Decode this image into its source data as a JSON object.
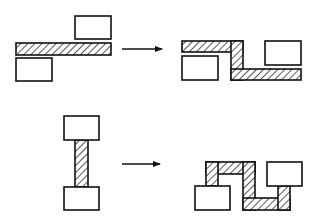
{
  "diagram": {
    "colors": {
      "stroke": "#111111",
      "fill": "#ffffff",
      "hatch": "#111111"
    },
    "rows": [
      {
        "name": "horizontal-connection",
        "before": {
          "blocks": [
            {
              "id": "block-upper-right",
              "x": 75,
              "y": 16,
              "w": 36,
              "h": 23
            },
            {
              "id": "block-lower-left",
              "x": 16,
              "y": 58,
              "w": 36,
              "h": 23
            }
          ],
          "wires": [
            {
              "id": "bar",
              "x": 16,
              "y": 43,
              "w": 95,
              "h": 12
            }
          ]
        },
        "arrow": {
          "x1": 122,
          "y1": 49,
          "x2": 162,
          "y2": 49
        },
        "after": {
          "blocks": [
            {
              "id": "block-left",
              "x": 182,
              "y": 56,
              "w": 36,
              "h": 24
            },
            {
              "id": "block-right",
              "x": 265,
              "y": 41,
              "w": 36,
              "h": 24
            }
          ],
          "wires": [
            {
              "id": "top-segment",
              "x": 182,
              "y": 41,
              "w": 61,
              "h": 11
            },
            {
              "id": "vertical-segment",
              "x": 231,
              "y": 41,
              "w": 12,
              "h": 39
            },
            {
              "id": "bottom-segment",
              "x": 231,
              "y": 69,
              "w": 70,
              "h": 11
            }
          ]
        }
      },
      {
        "name": "vertical-connection",
        "before": {
          "blocks": [
            {
              "id": "block-top",
              "x": 64,
              "y": 116,
              "w": 35,
              "h": 24
            },
            {
              "id": "block-bottom",
              "x": 64,
              "y": 187,
              "w": 35,
              "h": 23
            }
          ],
          "wires": [
            {
              "id": "stem",
              "x": 75,
              "y": 140,
              "w": 13,
              "h": 47
            }
          ]
        },
        "arrow": {
          "x1": 122,
          "y1": 164,
          "x2": 160,
          "y2": 164
        },
        "after": {
          "blocks": [
            {
              "id": "block-left",
              "x": 195,
              "y": 186,
              "w": 35,
              "h": 24
            },
            {
              "id": "block-right",
              "x": 267,
              "y": 162,
              "w": 35,
              "h": 24
            }
          ],
          "wires": [
            {
              "id": "top-segment",
              "x": 206,
              "y": 162,
              "w": 49,
              "h": 12
            },
            {
              "id": "left-drop",
              "x": 206,
              "y": 162,
              "w": 12,
              "h": 24
            },
            {
              "id": "middle-vertical",
              "x": 243,
              "y": 162,
              "w": 12,
              "h": 48
            },
            {
              "id": "bottom-segment",
              "x": 243,
              "y": 198,
              "w": 47,
              "h": 12
            },
            {
              "id": "right-rise",
              "x": 278,
              "y": 186,
              "w": 12,
              "h": 24
            }
          ]
        }
      }
    ]
  }
}
